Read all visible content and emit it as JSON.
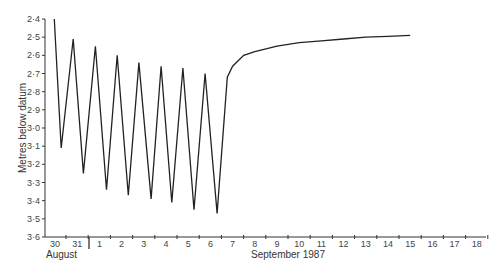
{
  "chart_data": {
    "type": "line",
    "title": "",
    "xlabel_left": "August",
    "xlabel_right": "September 1987",
    "ylabel": "Metres below datum",
    "ylim": [
      2.4,
      3.6
    ],
    "y_inverted": true,
    "yticks": [
      "2·4",
      "2·5",
      "2·6",
      "2·7",
      "2·8",
      "2·9",
      "3·0",
      "3·1",
      "3·2",
      "3·3",
      "3·4",
      "3·5",
      "3·6"
    ],
    "xticks": [
      "30",
      "31",
      "1",
      "2",
      "3",
      "4",
      "5",
      "6",
      "7",
      "8",
      "9",
      "10",
      "11",
      "12",
      "13",
      "14",
      "15",
      "16",
      "17",
      "18"
    ],
    "grid": false,
    "series": [
      {
        "name": "water level",
        "points": [
          {
            "day": 29.97,
            "value": 2.4
          },
          {
            "day": 30.28,
            "value": 3.11
          },
          {
            "day": 30.82,
            "value": 2.51
          },
          {
            "day": 31.28,
            "value": 3.25
          },
          {
            "day": 31.82,
            "value": 2.55
          },
          {
            "day": 32.32,
            "value": 3.34
          },
          {
            "day": 32.8,
            "value": 2.6
          },
          {
            "day": 33.3,
            "value": 3.37
          },
          {
            "day": 33.78,
            "value": 2.64
          },
          {
            "day": 34.33,
            "value": 3.39
          },
          {
            "day": 34.78,
            "value": 2.66
          },
          {
            "day": 35.26,
            "value": 3.41
          },
          {
            "day": 35.76,
            "value": 2.67
          },
          {
            "day": 36.26,
            "value": 3.45
          },
          {
            "day": 36.76,
            "value": 2.7
          },
          {
            "day": 37.3,
            "value": 3.47
          },
          {
            "day": 37.76,
            "value": 2.72
          },
          {
            "day": 38.0,
            "value": 2.66
          },
          {
            "day": 38.5,
            "value": 2.6
          },
          {
            "day": 39.0,
            "value": 2.58
          },
          {
            "day": 40.0,
            "value": 2.55
          },
          {
            "day": 41.0,
            "value": 2.53
          },
          {
            "day": 42.0,
            "value": 2.52
          },
          {
            "day": 43.0,
            "value": 2.51
          },
          {
            "day": 44.0,
            "value": 2.5
          },
          {
            "day": 45.0,
            "value": 2.495
          },
          {
            "day": 46.0,
            "value": 2.49
          }
        ]
      }
    ]
  }
}
